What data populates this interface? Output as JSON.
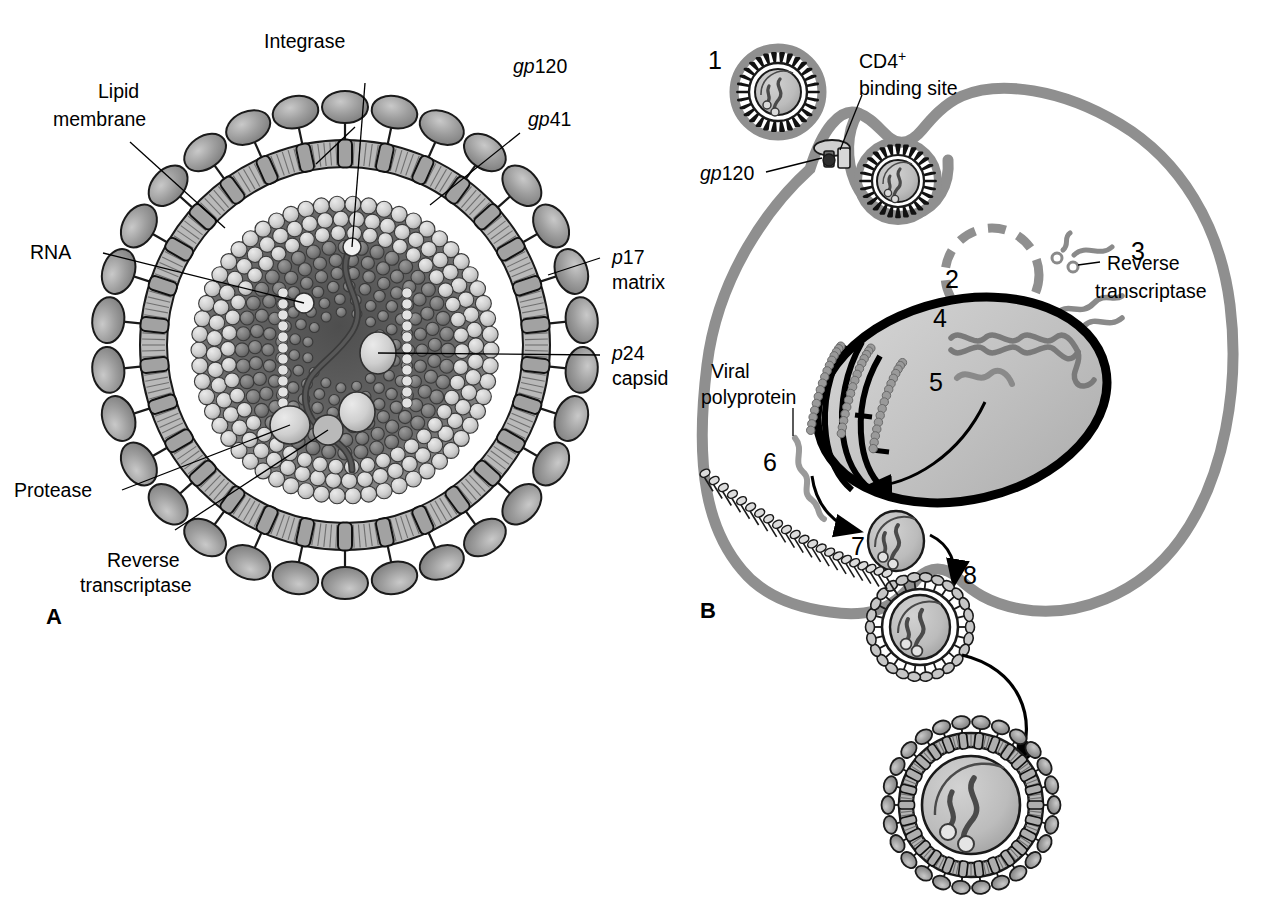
{
  "figure": {
    "panels": [
      {
        "id": "A",
        "label": "A",
        "caption": "HIV virion structure"
      },
      {
        "id": "B",
        "label": "B",
        "caption": "HIV replication cycle in a CD4+ cell"
      }
    ]
  },
  "panelA": {
    "label": "A",
    "labels": {
      "integrase": "Integrase",
      "gp120_prefix": "gp",
      "gp120_num": "120",
      "gp41_prefix": "gp",
      "gp41_num": "41",
      "lipid_line1": "Lipid",
      "lipid_line2": "membrane",
      "rna": "RNA",
      "p17_prefix": "p",
      "p17_num": "17",
      "p17_line2": "matrix",
      "p24_prefix": "p",
      "p24_num": "24",
      "p24_line2": "capsid",
      "protease": "Protease",
      "rt_line1": "Reverse",
      "rt_line2": "transcriptase"
    }
  },
  "panelB": {
    "label": "B",
    "steps": [
      {
        "number": "1",
        "meaning": "virion binds CD4+ receptor"
      },
      {
        "number": "2",
        "meaning": "endosome / uncoating"
      },
      {
        "number": "3",
        "meaning": "reverse transcription"
      },
      {
        "number": "4",
        "meaning": "proviral DNA integration in nucleus"
      },
      {
        "number": "5",
        "meaning": "viral RNA transcription"
      },
      {
        "number": "6",
        "meaning": "viral polyprotein translation"
      },
      {
        "number": "7",
        "meaning": "immature particle assembly"
      },
      {
        "number": "8",
        "meaning": "budding from plasma membrane"
      }
    ],
    "labels": {
      "cd4_line1": "CD4",
      "cd4_sup": "+",
      "cd4_line2": "binding site",
      "gp120_prefix": "gp",
      "gp120_num": "120",
      "rt_line1": "Reverse",
      "rt_line2": "transcriptase",
      "viral_line1": "Viral",
      "viral_line2": "polyprotein"
    }
  },
  "colors": {
    "ink": "#000000",
    "membrane_gray": "#8c8c8c",
    "envelope_fill": "#b5b5b5",
    "spike_fill": "#9a9a9a",
    "capsid_light": "#d8d8d8",
    "capsid_dark": "#6e6e6e",
    "core_shadow": "#4a4a4a",
    "nucleus_fill": "#c4c4c4",
    "background": "#ffffff"
  }
}
